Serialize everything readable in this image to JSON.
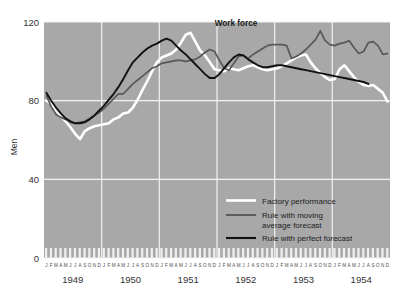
{
  "figure": {
    "background_color": "#ffffff",
    "plot_background_color": "#a8a8a8",
    "gridline_color": "#f2f2f2"
  },
  "chart_data": {
    "type": "line",
    "title": "",
    "annotation": "Work force",
    "xlabel": "",
    "ylabel": "Men",
    "ylim": [
      0,
      120
    ],
    "yticks": [
      0,
      40,
      80,
      120
    ],
    "ytick_labels": [
      "0",
      "40",
      "80",
      "120"
    ],
    "grid": true,
    "grid_axis": "both",
    "legend_position": "lower-right-inside",
    "x_major_categories": [
      "1949",
      "1950",
      "1951",
      "1952",
      "1953",
      "1954"
    ],
    "x_minor_labels": "JFMAMJJASOND",
    "x_minor_label_repeats": 6,
    "xlim_months": [
      0,
      72
    ],
    "series": [
      {
        "name": "Factory performance",
        "color": "#ffffff",
        "width": 2.6,
        "values": [
          80.0,
          78.5,
          75.0,
          72.0,
          69.5,
          66.5,
          63.0,
          60.5,
          64.5,
          66.0,
          67.0,
          67.5,
          68.0,
          68.5,
          70.5,
          71.5,
          73.5,
          74.0,
          76.5,
          80.5,
          85.5,
          90.0,
          95.0,
          99.5,
          102.0,
          103.0,
          104.0,
          106.0,
          109.5,
          113.5,
          114.5,
          110.0,
          105.5,
          103.0,
          99.5,
          96.0,
          95.5,
          95.0,
          96.5,
          96.0,
          95.5,
          96.5,
          97.5,
          98.0,
          97.0,
          96.0,
          95.5,
          96.0,
          96.5,
          97.5,
          99.0,
          100.5,
          102.0,
          103.0,
          103.5,
          99.5,
          96.5,
          94.0,
          92.0,
          90.5,
          91.0,
          96.0,
          98.0,
          95.0,
          92.0,
          89.5,
          88.0,
          87.5,
          88.0,
          86.0,
          84.0,
          79.5
        ]
      },
      {
        "name": "Rule with moving average forecast",
        "color": "#585858",
        "width": 1.7,
        "values": [
          82.5,
          77.0,
          73.0,
          71.5,
          70.5,
          69.0,
          68.5,
          69.0,
          69.5,
          71.0,
          72.5,
          74.0,
          76.0,
          78.5,
          81.0,
          83.5,
          83.5,
          86.0,
          88.5,
          90.5,
          92.5,
          94.5,
          96.5,
          97.5,
          99.0,
          99.5,
          100.0,
          100.5,
          100.5,
          100.0,
          100.5,
          101.0,
          102.5,
          104.5,
          106.0,
          105.0,
          100.5,
          96.5,
          95.5,
          99.0,
          102.5,
          103.0,
          101.5,
          103.5,
          105.0,
          106.5,
          108.0,
          108.5,
          108.5,
          108.5,
          108.0,
          101.5,
          102.5,
          104.0,
          106.0,
          108.5,
          111.0,
          115.5,
          110.5,
          108.5,
          108.0,
          109.0,
          109.5,
          110.5,
          107.0,
          104.0,
          105.0,
          109.5,
          110.0,
          108.0,
          103.5,
          104.0
        ]
      },
      {
        "name": "Rule with perfect forecast",
        "color": "#111111",
        "width": 1.9,
        "values": [
          84.0,
          80.0,
          76.5,
          73.5,
          71.0,
          69.5,
          68.5,
          68.5,
          69.0,
          70.5,
          72.5,
          75.0,
          77.5,
          80.5,
          83.5,
          87.0,
          91.0,
          95.5,
          99.5,
          102.0,
          104.5,
          106.5,
          108.0,
          109.0,
          110.5,
          111.5,
          110.5,
          108.0,
          105.5,
          103.5,
          101.0,
          98.5,
          96.0,
          93.5,
          91.5,
          91.5,
          93.5,
          96.5,
          99.5,
          102.0,
          103.5,
          103.0,
          101.0,
          99.5,
          98.0,
          97.0,
          97.0,
          97.5,
          98.0,
          98.0,
          97.5,
          97.0,
          96.5,
          96.0,
          95.5,
          95.0,
          94.5,
          94.0,
          93.5,
          93.0,
          92.5,
          92.0,
          91.5,
          91.0,
          90.5,
          90.0,
          89.5,
          88.5,
          null,
          null,
          null,
          null
        ],
        "ends_at_month_index": 67
      }
    ]
  },
  "legend": {
    "items": [
      {
        "label": "Factory performance",
        "color": "#ffffff"
      },
      {
        "label": "Rule with moving",
        "label2": "average forecast",
        "color": "#585858"
      },
      {
        "label": "Rule with perfect forecast",
        "color": "#111111"
      }
    ]
  }
}
